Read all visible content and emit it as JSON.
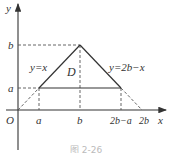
{
  "figure": {
    "caption": "图 2-26",
    "axes": {
      "x_label": "x",
      "y_label": "y",
      "origin_label": "O"
    },
    "x_ticks": [
      "a",
      "b",
      "2b−a",
      "2b"
    ],
    "y_ticks": [
      "a",
      "b"
    ],
    "curves": [
      {
        "label": "y=x",
        "equation": "y = x"
      },
      {
        "label": "y=2b−x",
        "equation": "y = 2b - x"
      }
    ],
    "region_label": "D",
    "colors": {
      "line": "#333333",
      "dashed": "#555555",
      "text": "#333333"
    }
  }
}
